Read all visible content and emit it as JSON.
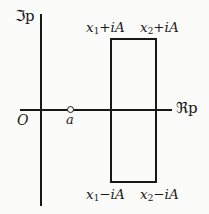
{
  "figure": {
    "type": "complex-plane-contour-diagram",
    "background_color": "#fbfbf9",
    "ink_color": "#181818"
  },
  "axes": {
    "vertical": {
      "label": "ℑp",
      "meaning": "imaginary-part-of-p"
    },
    "horizontal": {
      "label": "ℜp",
      "meaning": "real-part-of-p"
    },
    "origin_label": "O"
  },
  "markers": [
    {
      "name": "point-a",
      "label": "a",
      "style": "open-circle",
      "on_axis": "real"
    }
  ],
  "contour": {
    "shape": "rectangle",
    "corner_labels": {
      "top_left": {
        "variable": "x",
        "sub": "1",
        "operator": "+",
        "imaginary": "iA"
      },
      "top_right": {
        "variable": "x",
        "sub": "2",
        "operator": "+",
        "imaginary": "iA"
      },
      "bottom_left": {
        "variable": "x",
        "sub": "1",
        "operator": "−",
        "imaginary": "iA"
      },
      "bottom_right": {
        "variable": "x",
        "sub": "2",
        "operator": "−",
        "imaginary": "iA"
      }
    }
  }
}
